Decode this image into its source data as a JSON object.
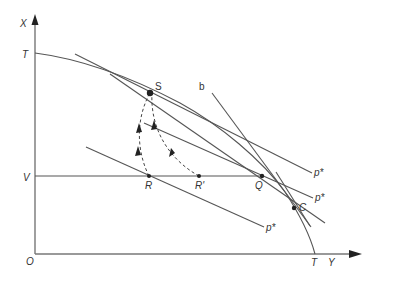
{
  "diagram": {
    "axes": {
      "vertical_label": "X",
      "horizontal_label": "Y",
      "origin_label": "O"
    },
    "labels": {
      "T_vertical": "T",
      "T_horizontal": "T",
      "V": "V",
      "S": "S",
      "b": "b",
      "R": "R",
      "R_prime": "R'",
      "Q": "Q",
      "C": "C",
      "p_star_top": "p*",
      "p_star_mid": "p*",
      "p_star_low": "p*"
    },
    "points": [
      {
        "name": "S",
        "x": 150,
        "y": 93
      },
      {
        "name": "R",
        "x": 149,
        "y": 176
      },
      {
        "name": "R'",
        "x": 199,
        "y": 176
      },
      {
        "name": "Q",
        "x": 262,
        "y": 176
      },
      {
        "name": "C",
        "x": 294,
        "y": 208
      }
    ],
    "colors": {
      "line": "#555555",
      "axis": "#777777",
      "point": "#222222",
      "background": "#ffffff"
    }
  }
}
